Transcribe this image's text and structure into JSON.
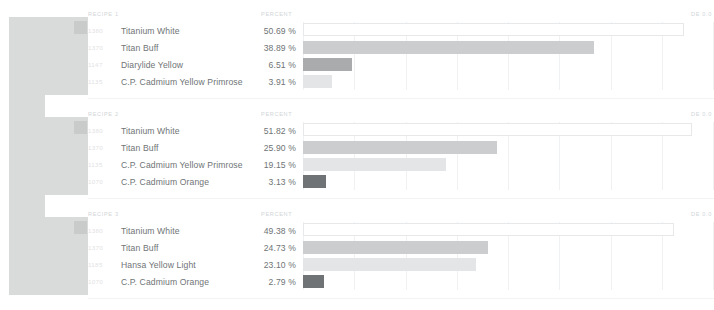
{
  "swatches": {
    "blocks": [
      {
        "left": 9,
        "top": 17,
        "width": 79,
        "height": 78,
        "color": "#d9dbdb",
        "chip": {
          "left": 65,
          "top": 21,
          "color": "#c9cbcb"
        }
      },
      {
        "left": 9,
        "top": 95,
        "width": 36,
        "height": 22,
        "color": "#d9dbdb",
        "chip": null
      },
      {
        "left": 9,
        "top": 117,
        "width": 79,
        "height": 78,
        "color": "#d9dbdb",
        "chip": {
          "left": 65,
          "top": 121,
          "color": "#c9cbcb"
        }
      },
      {
        "left": 9,
        "top": 195,
        "width": 36,
        "height": 22,
        "color": "#d9dbdb",
        "chip": null
      },
      {
        "left": 9,
        "top": 217,
        "width": 79,
        "height": 78,
        "color": "#d9dbdb",
        "chip": {
          "left": 65,
          "top": 221,
          "color": "#c9cbcb"
        }
      }
    ]
  },
  "columns": {
    "recipe_header": "RECIPE",
    "percent_header": "PERCENT",
    "de_header": "DE 0.0"
  },
  "recipes": [
    {
      "title": "RECIPE 1",
      "percent_label": "PERCENT",
      "de_label": "DE 0.0",
      "top": 6,
      "rows": [
        {
          "code": "1380",
          "name": "Titanium White",
          "percent": "50.69 %",
          "value": 50.69,
          "bar_style": "outline",
          "bar_color": "#ffffff"
        },
        {
          "code": "1370",
          "name": "Titan Buff",
          "percent": "38.89 %",
          "value": 38.89,
          "bar_style": "solid",
          "bar_color": "#cbcdce"
        },
        {
          "code": "1147",
          "name": "Diarylide Yellow",
          "percent": "6.51 %",
          "value": 6.51,
          "bar_style": "solid",
          "bar_color": "#a9abac"
        },
        {
          "code": "1135",
          "name": "C.P. Cadmium Yellow Primrose",
          "percent": "3.91 %",
          "value": 3.91,
          "bar_style": "solid",
          "bar_color": "#e3e5e6"
        }
      ]
    },
    {
      "title": "RECIPE 2",
      "percent_label": "PERCENT",
      "de_label": "DE 0.0",
      "top": 106,
      "rows": [
        {
          "code": "1380",
          "name": "Titanium White",
          "percent": "51.82 %",
          "value": 51.82,
          "bar_style": "outline",
          "bar_color": "#ffffff"
        },
        {
          "code": "1370",
          "name": "Titan Buff",
          "percent": "25.90 %",
          "value": 25.9,
          "bar_style": "solid",
          "bar_color": "#cbcdce"
        },
        {
          "code": "1135",
          "name": "C.P. Cadmium Yellow Primrose",
          "percent": "19.15 %",
          "value": 19.15,
          "bar_style": "solid",
          "bar_color": "#e3e5e6"
        },
        {
          "code": "1070",
          "name": "C.P. Cadmium Orange",
          "percent": "3.13 %",
          "value": 3.13,
          "bar_style": "solid",
          "bar_color": "#6f7375"
        }
      ]
    },
    {
      "title": "RECIPE 3",
      "percent_label": "PERCENT",
      "de_label": "DE 0.0",
      "top": 206,
      "rows": [
        {
          "code": "1380",
          "name": "Titanium White",
          "percent": "49.38 %",
          "value": 49.38,
          "bar_style": "outline",
          "bar_color": "#ffffff"
        },
        {
          "code": "1370",
          "name": "Titan Buff",
          "percent": "24.73 %",
          "value": 24.73,
          "bar_style": "solid",
          "bar_color": "#cbcdce"
        },
        {
          "code": "1185",
          "name": "Hansa Yellow Light",
          "percent": "23.10 %",
          "value": 23.1,
          "bar_style": "solid",
          "bar_color": "#e3e5e6"
        },
        {
          "code": "1070",
          "name": "C.P. Cadmium Orange",
          "percent": "2.79 %",
          "value": 2.79,
          "bar_style": "solid",
          "bar_color": "#6f7375"
        }
      ]
    }
  ],
  "chart_data": {
    "type": "bar",
    "orientation": "horizontal",
    "xlabel": "Percent",
    "ylabel": "",
    "xlim": [
      0,
      55
    ],
    "grid": true,
    "gridline_count": 9,
    "legend": "none",
    "series": [
      {
        "name": "RECIPE 1",
        "categories": [
          "Titanium White",
          "Titan Buff",
          "Diarylide Yellow",
          "C.P. Cadmium Yellow Primrose"
        ],
        "values": [
          50.69,
          38.89,
          6.51,
          3.91
        ]
      },
      {
        "name": "RECIPE 2",
        "categories": [
          "Titanium White",
          "Titan Buff",
          "C.P. Cadmium Yellow Primrose",
          "C.P. Cadmium Orange"
        ],
        "values": [
          51.82,
          25.9,
          19.15,
          3.13
        ]
      },
      {
        "name": "RECIPE 3",
        "categories": [
          "Titanium White",
          "Titan Buff",
          "Hansa Yellow Light",
          "C.P. Cadmium Orange"
        ],
        "values": [
          49.38,
          24.73,
          23.1,
          2.79
        ]
      }
    ]
  },
  "dividers": [
    {
      "top": 98
    },
    {
      "top": 198
    },
    {
      "top": 298
    }
  ]
}
